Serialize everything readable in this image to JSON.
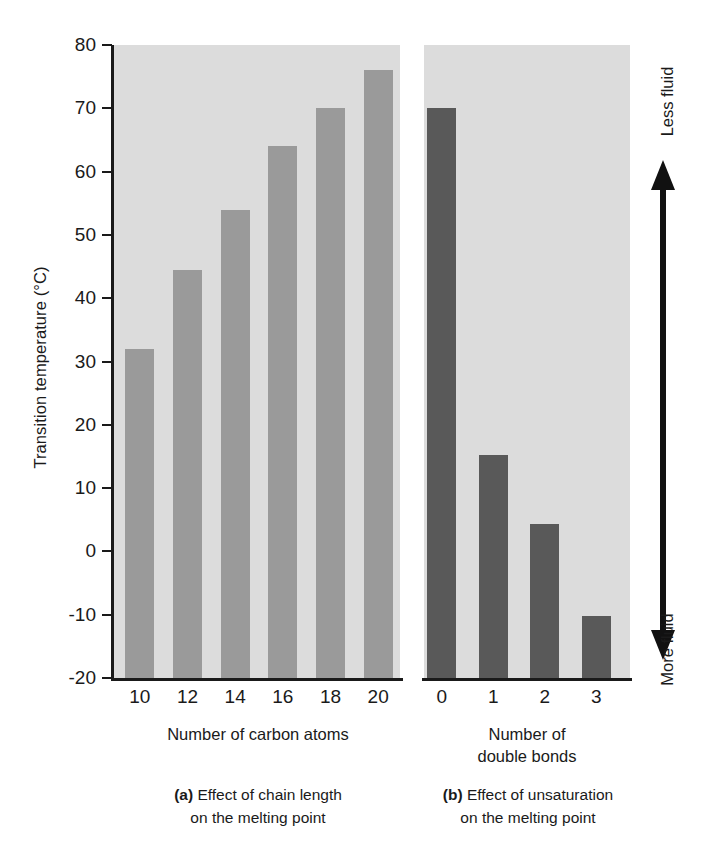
{
  "figure": {
    "y_axis_label": "Transition temperature (°C)",
    "fluidity_axis": {
      "top_label": "Less fluid",
      "bottom_label": "More fluid",
      "icon": "double-headed-vertical-arrow-icon"
    },
    "panel_a": {
      "x_axis_title": "Number of carbon atoms",
      "caption_prefix": "(a)",
      "caption_line1": " Effect of chain length",
      "caption_line2": "on the melting point"
    },
    "panel_b": {
      "x_axis_title_line1": "Number of",
      "x_axis_title_line2": "double bonds",
      "caption_prefix": "(b)",
      "caption_line1": " Effect of unsaturation",
      "caption_line2": "on the melting point"
    },
    "colors": {
      "panel_background": "#dcdcdc",
      "bar_panel_a": "#9a9a9a",
      "bar_panel_b": "#595959",
      "axis": "#1a1a1a",
      "page_background": "#ffffff"
    }
  },
  "chart_data": [
    {
      "type": "bar",
      "id": "panel-a",
      "title": "(a) Effect of chain length on the melting point",
      "xlabel": "Number of carbon atoms",
      "ylabel": "Transition temperature (°C)",
      "categories": [
        "10",
        "12",
        "14",
        "16",
        "18",
        "20"
      ],
      "values": [
        32,
        44.5,
        54,
        64,
        70,
        76
      ],
      "ylim": [
        -20,
        80
      ],
      "yticks": [
        80,
        70,
        60,
        50,
        40,
        30,
        20,
        10,
        0,
        -10,
        -20
      ],
      "ytick_labels": [
        "80",
        "70",
        "60",
        "50",
        "40",
        "30",
        "20",
        "10",
        "0",
        "-10",
        "-20"
      ],
      "grid": false,
      "legend": "none",
      "bar_color": "#9a9a9a"
    },
    {
      "type": "bar",
      "id": "panel-b",
      "title": "(b) Effect of unsaturation on the melting point",
      "xlabel": "Number of double bonds",
      "ylabel": "Transition temperature (°C)",
      "categories": [
        "0",
        "1",
        "2",
        "3"
      ],
      "values": [
        70,
        15.2,
        4.4,
        -10.2
      ],
      "ylim": [
        -20,
        80
      ],
      "grid": false,
      "legend": "none",
      "bar_color": "#595959"
    }
  ]
}
